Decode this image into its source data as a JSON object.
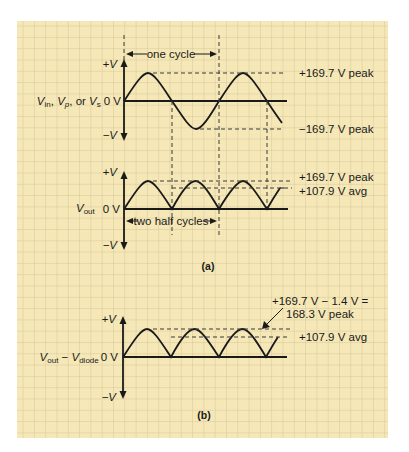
{
  "colors": {
    "paper": "#f6e8b8",
    "grid": "#cdbf95",
    "ink": "#1a1a1a"
  },
  "panel_a": {
    "caption": "(a)",
    "input": {
      "label_v1": "V",
      "label_v1_sub": "in",
      "label_sep1": ", ",
      "label_v2": "V",
      "label_v2_sub": "p",
      "label_sep2": ", or ",
      "label_v3": "V",
      "label_v3_sub": "s",
      "zero_label": "0 V",
      "pos_axis": "+V",
      "neg_axis": "−V",
      "pos_peak": "+169.7 V peak",
      "neg_peak": "−169.7 V peak",
      "span_label": "one cycle"
    },
    "output": {
      "label_v": "V",
      "label_sub": "out",
      "zero_label": "0 V",
      "pos_axis": "+V",
      "neg_axis": "−V",
      "peak": "+169.7 V peak",
      "avg": "+107.9 V avg",
      "span_label": "two half cycles"
    }
  },
  "panel_b": {
    "caption": "(b)",
    "label_v1": "V",
    "label_v1_sub": "out",
    "label_minus": " − ",
    "label_v2": "V",
    "label_v2_sub": "diode",
    "zero_label": "0 V",
    "pos_axis": "+V",
    "neg_axis": "−V",
    "peak_line1": "+169.7 V − 1.4 V =",
    "peak_line2": "168.3 V peak",
    "avg": "+107.9 V avg"
  }
}
